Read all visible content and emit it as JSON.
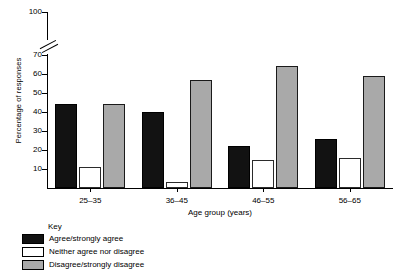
{
  "chart_data": {
    "type": "bar",
    "title": "",
    "xlabel": "Age group (years)",
    "ylabel": "Percentage of responses",
    "categories": [
      "25–35",
      "36–45",
      "46–55",
      "56–65"
    ],
    "series": [
      {
        "name": "Agree/strongly agree",
        "values": [
          44,
          40,
          22,
          26
        ],
        "color": "#121212"
      },
      {
        "name": "Neither agree nor disagree",
        "values": [
          11,
          3,
          15,
          16
        ],
        "color": "#ffffff"
      },
      {
        "name": "Disagree/strongly disagree",
        "values": [
          44,
          57,
          64,
          59
        ],
        "color": "#a9a9a9"
      }
    ],
    "ylim": [
      0,
      100
    ],
    "yticks": [
      10,
      20,
      30,
      40,
      50,
      60,
      70,
      100
    ],
    "axis_break": {
      "between": [
        70,
        100
      ],
      "present": true
    },
    "grid": false,
    "legend_position": "bottom-left"
  },
  "legend": {
    "title": "Key",
    "entries": [
      {
        "label": "Agree/strongly agree"
      },
      {
        "label": "Neither agree nor disagree"
      },
      {
        "label": "Disagree/strongly disagree"
      }
    ]
  }
}
